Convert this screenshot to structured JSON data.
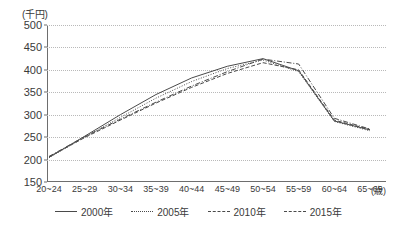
{
  "chart_data": {
    "type": "line",
    "title": "",
    "xlabel": "(歳)",
    "ylabel": "(千円)",
    "y_unit": "(千円)",
    "x_unit": "(歳)",
    "ylim": [
      150,
      500
    ],
    "ytick_step": 50,
    "yticks": [
      "500",
      "450",
      "400",
      "350",
      "300",
      "250",
      "200",
      "150"
    ],
    "grid": true,
    "legend_position": "bottom",
    "categories": [
      "20~24",
      "25~29",
      "30~34",
      "35~39",
      "40~44",
      "45~49",
      "50~54",
      "55~59",
      "60~64",
      "65~69"
    ],
    "series": [
      {
        "name": "2000年",
        "style": "solid",
        "values": [
          205,
          252,
          300,
          345,
          382,
          408,
          425,
          398,
          286,
          266
        ]
      },
      {
        "name": "2005年",
        "style": "dotted",
        "values": [
          204,
          250,
          294,
          337,
          374,
          403,
          422,
          396,
          285,
          264
        ]
      },
      {
        "name": "2010年",
        "style": "dashed",
        "values": [
          206,
          249,
          288,
          326,
          361,
          392,
          416,
          400,
          288,
          267
        ]
      },
      {
        "name": "2015年",
        "style": "dashdot",
        "values": [
          207,
          251,
          290,
          328,
          364,
          396,
          424,
          413,
          292,
          268
        ]
      }
    ]
  },
  "legend": {
    "items": [
      {
        "label": "2000年",
        "style": "solid"
      },
      {
        "label": "2005年",
        "style": "dotted"
      },
      {
        "label": "2010年",
        "style": "dashed"
      },
      {
        "label": "2015年",
        "style": "dashdot"
      }
    ]
  },
  "colors": {
    "line": "#4a4a4a",
    "axis": "#6e6e6e",
    "grid": "#b9b9b9",
    "text": "#3a3a3a",
    "background": "#ffffff"
  }
}
